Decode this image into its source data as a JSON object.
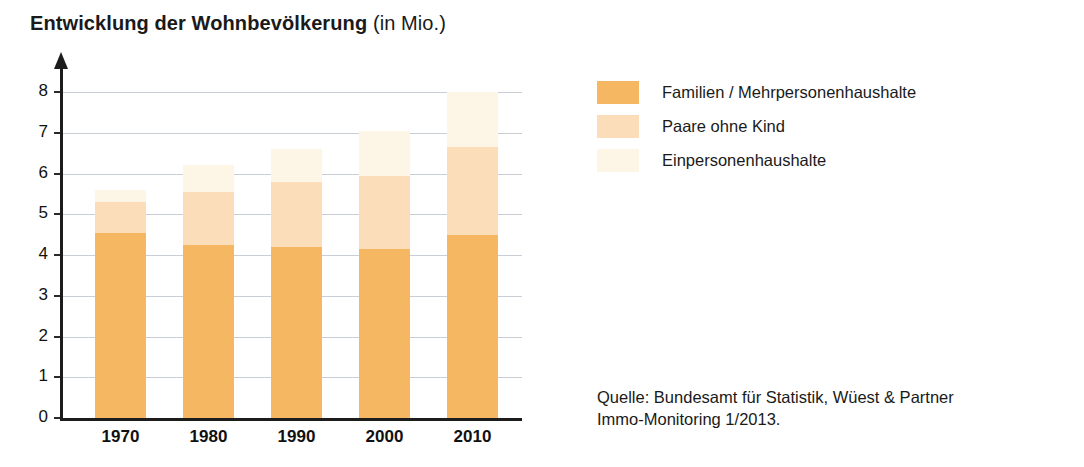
{
  "title": {
    "main": "Entwicklung der Wohnbevölkerung",
    "unit": "(in Mio.)"
  },
  "legend": {
    "items": [
      {
        "label": "Familien / Mehrpersonenhaushalte",
        "color": "#F6B763"
      },
      {
        "label": "Paare ohne Kind",
        "color": "#FBDDB9"
      },
      {
        "label": "Einpersonenhaushalte",
        "color": "#FDF6E6"
      }
    ]
  },
  "source": {
    "line1": "Quelle: Bundesamt für Statistik, Wüest & Partner",
    "line2": "Immo-Monitoring 1/2013."
  },
  "axis": {
    "y_ticks": [
      "8",
      "7",
      "6",
      "5",
      "4",
      "3",
      "2",
      "1",
      "0"
    ],
    "x_ticks": [
      "1970",
      "1980",
      "1990",
      "2000",
      "2010"
    ]
  },
  "chart_data": {
    "type": "bar",
    "title": "Entwicklung der Wohnbevölkerung (in Mio.)",
    "subtitle": "",
    "xlabel": "",
    "ylabel": "in Mio.",
    "ylim": [
      0,
      8
    ],
    "ytick_step": 1,
    "grid": true,
    "stacked": true,
    "legend_position": "right",
    "categories": [
      "1970",
      "1980",
      "1990",
      "2000",
      "2010"
    ],
    "series": [
      {
        "name": "Familien / Mehrpersonenhaushalte",
        "color": "#F6B763",
        "values": [
          4.55,
          4.25,
          4.2,
          4.15,
          4.5
        ]
      },
      {
        "name": "Paare ohne Kind",
        "color": "#FBDDB9",
        "values": [
          0.75,
          1.3,
          1.6,
          1.8,
          2.15
        ]
      },
      {
        "name": "Einpersonenhaushalte",
        "color": "#FDF6E6",
        "values": [
          0.3,
          0.65,
          0.8,
          1.1,
          1.35
        ]
      }
    ],
    "totals": [
      5.6,
      6.2,
      6.6,
      7.05,
      8.0
    ],
    "annotations": [
      "Quelle: Bundesamt für Statistik, Wüest & Partner Immo-Monitoring 1/2013."
    ]
  }
}
